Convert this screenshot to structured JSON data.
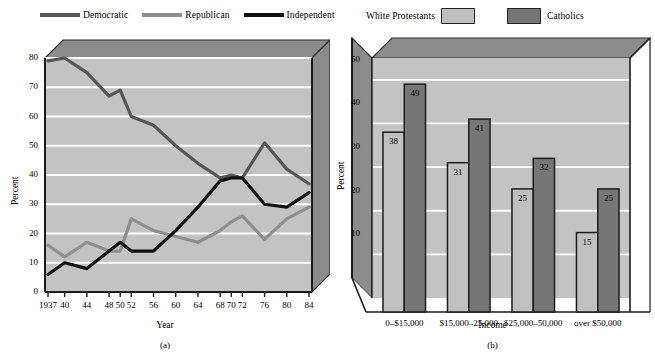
{
  "figure": {
    "panel_a_caption": "(a)",
    "panel_b_caption": "(b)"
  },
  "chart_data": [
    {
      "id": "party-identification",
      "type": "line",
      "title": "",
      "xlabel": "Year",
      "ylabel": "Percent",
      "ylim": [
        0,
        80
      ],
      "yticks": [
        0,
        10,
        20,
        30,
        40,
        50,
        60,
        70,
        80
      ],
      "xticklabels": [
        "1937",
        "40",
        "44",
        "48",
        "50",
        "52",
        "56",
        "60",
        "64",
        "68",
        "70",
        "72",
        "76",
        "80",
        "84"
      ],
      "x": [
        1937,
        1940,
        1944,
        1948,
        1950,
        1952,
        1956,
        1960,
        1964,
        1968,
        1970,
        1972,
        1976,
        1980,
        1984
      ],
      "grid": true,
      "legend_position": "top",
      "series": [
        {
          "name": "Democratic",
          "color": "#565656",
          "values": [
            79,
            80,
            75,
            67,
            69,
            60,
            57,
            50,
            44,
            39,
            40,
            39,
            51,
            42,
            37
          ]
        },
        {
          "name": "Republican",
          "color": "#8e8e8e",
          "values": [
            16,
            12,
            17,
            14,
            14,
            25,
            21,
            19,
            17,
            21,
            24,
            26,
            18,
            25,
            29
          ]
        },
        {
          "name": "Independent",
          "color": "#111111",
          "values": [
            6,
            10,
            8,
            14,
            17,
            14,
            14,
            21,
            29,
            38,
            39,
            39,
            30,
            29,
            34
          ]
        }
      ]
    },
    {
      "id": "income-by-religion",
      "type": "bar",
      "title": "",
      "xlabel": "Income",
      "ylabel": "Percent",
      "ylim": [
        0,
        55
      ],
      "yticks": [
        10,
        20,
        30,
        40,
        50
      ],
      "categories": [
        "0–$15,000",
        "$15,000–25,000",
        "$25,000–50,000",
        "over $50,000"
      ],
      "grid": true,
      "legend_position": "top",
      "series": [
        {
          "name": "White Protestants",
          "color": "#c0c0c0",
          "values": [
            38,
            31,
            25,
            15
          ]
        },
        {
          "name": "Catholics",
          "color": "#767676",
          "values": [
            49,
            41,
            32,
            25
          ]
        }
      ]
    }
  ]
}
